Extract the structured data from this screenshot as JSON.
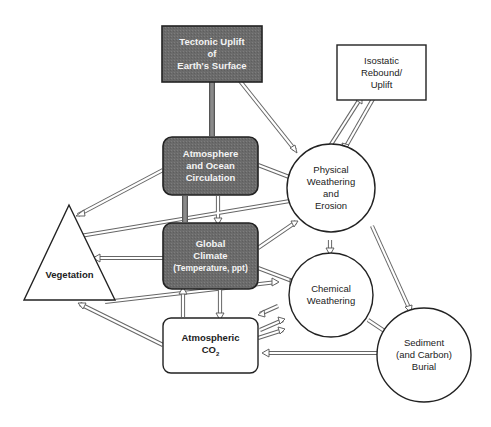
{
  "diagram": {
    "colors": {
      "dark_fill": "#6e6e6e",
      "stroke": "#2a2a2a",
      "arrow": "#555555",
      "light_fill": "#ffffff"
    },
    "nodes": {
      "tectonic": {
        "line1": "Tectonic Uplift",
        "line2": "of",
        "line3": "Earth's Surface"
      },
      "atmosphere": {
        "line1": "Atmosphere",
        "line2": "and Ocean",
        "line3": "Circulation"
      },
      "climate": {
        "line1": "Global",
        "line2": "Climate",
        "line3": "(Temperature, ppt)"
      },
      "co2": {
        "line1": "Atmospheric",
        "line2": "CO",
        "sub": "2"
      },
      "vegetation": {
        "line1": "Vegetation"
      },
      "isostatic": {
        "line1": "Isostatic",
        "line2": "Rebound/",
        "line3": "Uplift"
      },
      "physical": {
        "line1": "Physical",
        "line2": "Weathering",
        "line3": "and",
        "line4": "Erosion"
      },
      "chemical": {
        "line1": "Chemical",
        "line2": "Weathering"
      },
      "sediment": {
        "line1": "Sediment",
        "line2": "(and Carbon)",
        "line3": "Burial"
      }
    },
    "edges": [
      {
        "from": "Tectonic Uplift of Earth's Surface",
        "to": "Atmosphere and Ocean Circulation"
      },
      {
        "from": "Tectonic Uplift of Earth's Surface",
        "to": "Physical Weathering and Erosion"
      },
      {
        "from": "Atmosphere and Ocean Circulation",
        "to": "Global Climate"
      },
      {
        "from": "Global Climate",
        "to": "Atmosphere and Ocean Circulation"
      },
      {
        "from": "Atmosphere and Ocean Circulation",
        "to": "Vegetation"
      },
      {
        "from": "Atmosphere and Ocean Circulation",
        "to": "Physical Weathering and Erosion"
      },
      {
        "from": "Vegetation",
        "to": "Physical Weathering and Erosion"
      },
      {
        "from": "Global Climate",
        "to": "Vegetation"
      },
      {
        "from": "Global Climate",
        "to": "Physical Weathering and Erosion"
      },
      {
        "from": "Global Climate",
        "to": "Chemical Weathering"
      },
      {
        "from": "Global Climate",
        "to": "Atmospheric CO2"
      },
      {
        "from": "Atmospheric CO2",
        "to": "Global Climate"
      },
      {
        "from": "Vegetation",
        "to": "Chemical Weathering"
      },
      {
        "from": "Atmospheric CO2",
        "to": "Vegetation"
      },
      {
        "from": "Chemical Weathering",
        "to": "Atmospheric CO2"
      },
      {
        "from": "Atmospheric CO2",
        "to": "Chemical Weathering"
      },
      {
        "from": "Physical Weathering and Erosion",
        "to": "Isostatic Rebound/Uplift"
      },
      {
        "from": "Isostatic Rebound/Uplift",
        "to": "Physical Weathering and Erosion"
      },
      {
        "from": "Physical Weathering and Erosion",
        "to": "Chemical Weathering"
      },
      {
        "from": "Physical Weathering and Erosion",
        "to": "Sediment (and Carbon) Burial"
      },
      {
        "from": "Chemical Weathering",
        "to": "Sediment (and Carbon) Burial"
      },
      {
        "from": "Sediment (and Carbon) Burial",
        "to": "Atmospheric CO2"
      }
    ]
  }
}
